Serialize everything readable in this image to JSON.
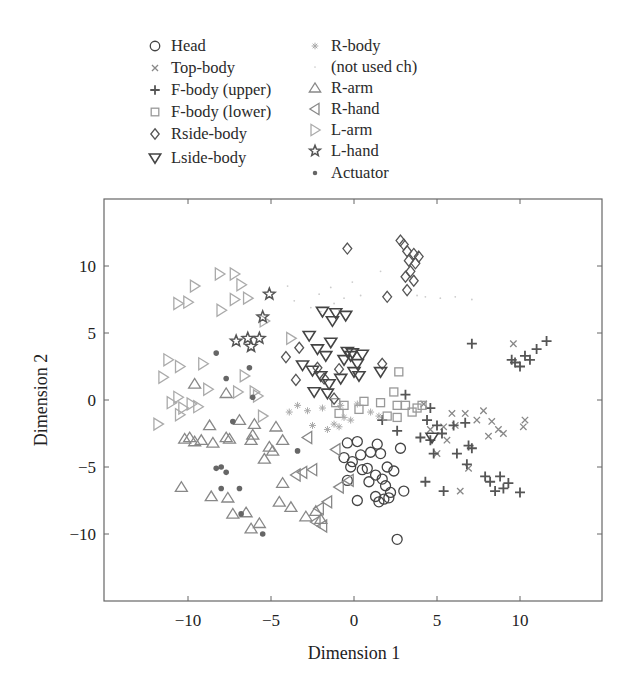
{
  "chart_data": {
    "type": "scatter",
    "title": "",
    "xlabel": "Dimension 1",
    "ylabel": "Dimension 2",
    "xlim": [
      -15,
      15
    ],
    "ylim": [
      -15,
      15
    ],
    "xticks": [
      -10,
      -5,
      0,
      5,
      10
    ],
    "yticks": [
      -10,
      -5,
      0,
      5,
      10
    ],
    "xtick_labels": [
      "−10",
      "−5",
      "0",
      "5",
      "10"
    ],
    "ytick_labels": [
      "−10",
      "−5",
      "0",
      "5",
      "10"
    ],
    "grid": false,
    "legend_position": "above plot, two columns",
    "series": [
      {
        "name": "Head",
        "marker": "circle",
        "color": "#444444",
        "points": [
          [
            -0.4,
            -3.2
          ],
          [
            0.2,
            -3.1
          ],
          [
            1.4,
            -3.3
          ],
          [
            2.8,
            -3.6
          ],
          [
            -0.6,
            -4.3
          ],
          [
            0.4,
            -4.1
          ],
          [
            1.0,
            -3.9
          ],
          [
            1.6,
            -4.0
          ],
          [
            -0.2,
            -5.0
          ],
          [
            0.5,
            -5.2
          ],
          [
            0.8,
            -5.1
          ],
          [
            1.3,
            -5.6
          ],
          [
            2.0,
            -5.0
          ],
          [
            2.4,
            -5.3
          ],
          [
            -0.4,
            -6.0
          ],
          [
            0.9,
            -6.1
          ],
          [
            1.9,
            -6.4
          ],
          [
            2.2,
            -6.9
          ],
          [
            3.0,
            -6.8
          ],
          [
            0.2,
            -7.5
          ],
          [
            1.5,
            -7.6
          ],
          [
            1.8,
            -7.4
          ],
          [
            2.1,
            -7.3
          ],
          [
            1.3,
            -7.2
          ],
          [
            2.6,
            -10.4
          ],
          [
            -0.1,
            -4.6
          ],
          [
            1.7,
            -5.9
          ]
        ]
      },
      {
        "name": "Top-body",
        "marker": "x",
        "color": "#888888",
        "points": [
          [
            4.2,
            -0.3
          ],
          [
            5.4,
            -2.0
          ],
          [
            6.1,
            -1.9
          ],
          [
            7.4,
            -1.5
          ],
          [
            8.3,
            -1.6
          ],
          [
            8.7,
            -2.2
          ],
          [
            9.0,
            -2.5
          ],
          [
            10.2,
            -2.0
          ],
          [
            6.7,
            -1.0
          ],
          [
            7.8,
            -0.8
          ],
          [
            4.6,
            -2.2
          ],
          [
            5.6,
            -3.0
          ],
          [
            5.0,
            -4.0
          ],
          [
            6.9,
            -5.1
          ],
          [
            9.6,
            4.2
          ],
          [
            6.4,
            -6.8
          ],
          [
            10.3,
            -1.5
          ],
          [
            8.1,
            -2.7
          ],
          [
            5.9,
            -1.0
          ]
        ]
      },
      {
        "name": "F-body (upper)",
        "marker": "plus",
        "color": "#555555",
        "points": [
          [
            7.1,
            4.2
          ],
          [
            9.5,
            3.0
          ],
          [
            10.3,
            3.3
          ],
          [
            11.0,
            3.8
          ],
          [
            11.6,
            4.4
          ],
          [
            10.0,
            2.5
          ],
          [
            9.7,
            2.8
          ],
          [
            10.6,
            3.0
          ],
          [
            4.6,
            -0.6
          ],
          [
            4.4,
            -1.5
          ],
          [
            5.0,
            -1.9
          ],
          [
            6.0,
            -1.9
          ],
          [
            6.7,
            -1.7
          ],
          [
            5.3,
            -2.5
          ],
          [
            4.6,
            -3.0
          ],
          [
            6.2,
            -4.0
          ],
          [
            6.9,
            -3.4
          ],
          [
            7.1,
            -3.6
          ],
          [
            4.0,
            -2.8
          ],
          [
            4.8,
            -4.0
          ],
          [
            6.8,
            -4.8
          ],
          [
            7.9,
            -5.7
          ],
          [
            8.2,
            -6.1
          ],
          [
            8.8,
            -5.7
          ],
          [
            9.3,
            -6.2
          ],
          [
            9.0,
            -6.6
          ],
          [
            10.0,
            -6.9
          ],
          [
            8.5,
            -6.8
          ],
          [
            4.3,
            -6.1
          ],
          [
            5.4,
            -6.8
          ],
          [
            3.1,
            0.4
          ],
          [
            2.6,
            -2.3
          ],
          [
            1.7,
            -1.5
          ]
        ]
      },
      {
        "name": "F-body (lower)",
        "marker": "square",
        "color": "#999999",
        "points": [
          [
            2.7,
            2.1
          ],
          [
            2.4,
            0.6
          ],
          [
            0.6,
            -0.1
          ],
          [
            1.6,
            -0.2
          ],
          [
            2.6,
            -0.4
          ],
          [
            3.1,
            -0.4
          ],
          [
            2.0,
            -1.2
          ],
          [
            2.6,
            -1.3
          ],
          [
            3.5,
            -0.9
          ],
          [
            3.8,
            -0.6
          ],
          [
            4.1,
            -0.4
          ],
          [
            -0.6,
            -0.4
          ],
          [
            -1.1,
            -0.2
          ],
          [
            0.3,
            -0.7
          ],
          [
            -0.9,
            -1.0
          ]
        ]
      },
      {
        "name": "Rside-body",
        "marker": "diamond",
        "color": "#555555",
        "points": [
          [
            -0.4,
            11.3
          ],
          [
            2.8,
            11.9
          ],
          [
            3.0,
            11.6
          ],
          [
            3.2,
            11.1
          ],
          [
            3.6,
            10.9
          ],
          [
            3.9,
            10.7
          ],
          [
            3.3,
            10.4
          ],
          [
            3.7,
            10.2
          ],
          [
            3.4,
            9.6
          ],
          [
            3.1,
            9.2
          ],
          [
            3.6,
            8.9
          ],
          [
            3.2,
            8.2
          ],
          [
            2.0,
            7.7
          ],
          [
            -4.1,
            3.2
          ],
          [
            -3.3,
            3.9
          ],
          [
            -2.2,
            2.4
          ],
          [
            -1.8,
            1.6
          ],
          [
            -3.5,
            1.5
          ],
          [
            -0.9,
            2.3
          ],
          [
            -1.2,
            0.1
          ],
          [
            1.7,
            2.7
          ]
        ]
      },
      {
        "name": "Lside-body",
        "marker": "triangle-down",
        "color": "#444444",
        "points": [
          [
            -1.9,
            6.6
          ],
          [
            -1.1,
            6.5
          ],
          [
            -0.5,
            6.3
          ],
          [
            -1.3,
            5.9
          ],
          [
            -2.7,
            4.8
          ],
          [
            -1.4,
            4.3
          ],
          [
            -2.2,
            3.8
          ],
          [
            -1.7,
            3.3
          ],
          [
            -0.4,
            3.6
          ],
          [
            -0.1,
            3.5
          ],
          [
            0.5,
            3.4
          ],
          [
            -0.6,
            3.0
          ],
          [
            0.2,
            2.7
          ],
          [
            -3.1,
            2.6
          ],
          [
            -2.5,
            2.2
          ],
          [
            -2.0,
            1.8
          ],
          [
            -1.5,
            1.2
          ],
          [
            -0.8,
            1.6
          ],
          [
            1.6,
            2.1
          ],
          [
            0.3,
            1.8
          ],
          [
            -2.4,
            0.6
          ],
          [
            -1.6,
            0.5
          ],
          [
            4.7,
            -2.8
          ],
          [
            -0.2,
            3.3
          ],
          [
            0.0,
            2.1
          ]
        ]
      },
      {
        "name": "R-body",
        "marker": "asterisk",
        "color": "#aaaaaa",
        "points": [
          [
            -3.9,
            -0.9
          ],
          [
            -2.8,
            -0.8
          ],
          [
            -1.9,
            -0.6
          ],
          [
            -1.2,
            -1.8
          ],
          [
            -0.6,
            -1.3
          ],
          [
            -0.2,
            -1.5
          ],
          [
            -0.8,
            -0.4
          ],
          [
            -2.5,
            -1.9
          ],
          [
            -1.6,
            -2.2
          ],
          [
            -0.9,
            -2.0
          ],
          [
            0.2,
            -0.3
          ],
          [
            1.0,
            -0.9
          ],
          [
            1.5,
            -1.2
          ],
          [
            -3.4,
            -0.4
          ]
        ]
      },
      {
        "name": "(not used ch)",
        "marker": "dot-small",
        "color": "#cccccc",
        "points": [
          [
            -2.6,
            6.9
          ],
          [
            -2.1,
            7.9
          ],
          [
            -1.4,
            8.4
          ],
          [
            -0.6,
            7.6
          ],
          [
            -1.2,
            7.2
          ],
          [
            -2.0,
            6.6
          ],
          [
            1.6,
            9.6
          ],
          [
            5.2,
            7.6
          ],
          [
            6.1,
            7.7
          ],
          [
            7.1,
            7.5
          ],
          [
            3.8,
            7.8
          ],
          [
            4.3,
            7.7
          ],
          [
            -4.0,
            8.5
          ],
          [
            -3.6,
            7.4
          ],
          [
            -0.1,
            8.8
          ],
          [
            0.4,
            7.8
          ]
        ]
      },
      {
        "name": "R-arm",
        "marker": "triangle-up",
        "color": "#888888",
        "points": [
          [
            -8.7,
            -1.9
          ],
          [
            -9.2,
            -3.0
          ],
          [
            -10.2,
            -2.9
          ],
          [
            -9.9,
            -2.8
          ],
          [
            -9.6,
            -3.1
          ],
          [
            -8.5,
            -3.2
          ],
          [
            -7.7,
            -2.8
          ],
          [
            -7.5,
            -2.9
          ],
          [
            -6.1,
            -2.6
          ],
          [
            -6.2,
            -3.0
          ],
          [
            -6.0,
            -1.8
          ],
          [
            -4.7,
            -2.0
          ],
          [
            -4.3,
            -3.0
          ],
          [
            -5.1,
            -3.5
          ],
          [
            -4.9,
            -3.8
          ],
          [
            -5.4,
            -4.4
          ],
          [
            -10.4,
            -6.5
          ],
          [
            -8.6,
            -7.2
          ],
          [
            -7.6,
            -7.3
          ],
          [
            -7.3,
            -8.5
          ],
          [
            -6.5,
            -8.4
          ],
          [
            -6.2,
            -9.6
          ],
          [
            -5.7,
            -9.2
          ],
          [
            -4.3,
            -6.2
          ],
          [
            -4.5,
            -7.6
          ],
          [
            -3.8,
            -8.0
          ],
          [
            -2.3,
            -8.3
          ],
          [
            -2.0,
            -8.9
          ],
          [
            -2.9,
            -8.7
          ],
          [
            -6.9,
            -1.5
          ],
          [
            -7.7,
            0.5
          ],
          [
            -9.6,
            1.2
          ]
        ]
      },
      {
        "name": "R-hand",
        "marker": "triangle-left",
        "color": "#888888",
        "points": [
          [
            -3.1,
            -5.4
          ],
          [
            -3.5,
            -5.6
          ],
          [
            -2.1,
            -8.1
          ],
          [
            -1.9,
            -9.4
          ],
          [
            -2.3,
            -9.1
          ],
          [
            -1.1,
            -3.7
          ],
          [
            -2.5,
            -5.2
          ],
          [
            -0.3,
            -6.0
          ],
          [
            -2.8,
            -2.8
          ],
          [
            -0.9,
            -6.5
          ],
          [
            -1.6,
            -7.6
          ]
        ]
      },
      {
        "name": "L-arm",
        "marker": "triangle-right",
        "color": "#aaaaaa",
        "points": [
          [
            -9.6,
            8.5
          ],
          [
            -8.1,
            9.4
          ],
          [
            -7.2,
            9.4
          ],
          [
            -6.8,
            8.6
          ],
          [
            -6.4,
            7.6
          ],
          [
            -7.2,
            7.5
          ],
          [
            -8.0,
            6.7
          ],
          [
            -10.6,
            7.2
          ],
          [
            -10.0,
            7.3
          ],
          [
            -5.4,
            5.9
          ],
          [
            -3.8,
            4.6
          ],
          [
            -11.2,
            3.0
          ],
          [
            -10.5,
            2.5
          ],
          [
            -11.5,
            1.7
          ],
          [
            -9.1,
            2.7
          ],
          [
            -6.6,
            1.8
          ],
          [
            -7.0,
            0.6
          ],
          [
            -6.0,
            0.6
          ],
          [
            -5.8,
            0.3
          ],
          [
            -10.6,
            0.2
          ],
          [
            -11.0,
            -0.2
          ],
          [
            -10.3,
            -0.6
          ],
          [
            -9.4,
            -0.5
          ],
          [
            -9.8,
            -0.3
          ],
          [
            -11.8,
            -1.8
          ],
          [
            -10.5,
            -1.1
          ],
          [
            -8.8,
            0.8
          ],
          [
            -5.5,
            -1.2
          ]
        ]
      },
      {
        "name": "L-hand",
        "marker": "star",
        "color": "#555555",
        "points": [
          [
            -5.1,
            7.9
          ],
          [
            -5.5,
            6.2
          ],
          [
            -7.1,
            4.4
          ],
          [
            -6.4,
            4.6
          ],
          [
            -6.2,
            4.0
          ],
          [
            -5.7,
            4.6
          ]
        ]
      },
      {
        "name": "Actuator",
        "marker": "dot",
        "color": "#666666",
        "points": [
          [
            -8.3,
            3.5
          ],
          [
            -7.7,
            1.6
          ],
          [
            -6.3,
            2.4
          ],
          [
            -6.1,
            0.2
          ],
          [
            -7.3,
            -1.6
          ],
          [
            -8.3,
            -5.1
          ],
          [
            -8.0,
            -5.0
          ],
          [
            -7.7,
            -5.4
          ],
          [
            -6.9,
            -6.6
          ],
          [
            -3.4,
            -3.8
          ],
          [
            -6.8,
            -8.5
          ],
          [
            -5.5,
            -10.0
          ],
          [
            -8.0,
            -6.6
          ]
        ]
      }
    ]
  },
  "legend": {
    "left": [
      {
        "label": "Head",
        "marker": "circle"
      },
      {
        "label": "Top-body",
        "marker": "x"
      },
      {
        "label": "F-body (upper)",
        "marker": "plus"
      },
      {
        "label": "F-body (lower)",
        "marker": "square"
      },
      {
        "label": "Rside-body",
        "marker": "diamond"
      },
      {
        "label": "Lside-body",
        "marker": "triangle-down"
      }
    ],
    "right": [
      {
        "label": "R-body",
        "marker": "asterisk"
      },
      {
        "label": "(not used ch)",
        "marker": "dot-small"
      },
      {
        "label": "R-arm",
        "marker": "triangle-up"
      },
      {
        "label": "R-hand",
        "marker": "triangle-left"
      },
      {
        "label": "L-arm",
        "marker": "triangle-right"
      },
      {
        "label": "L-hand",
        "marker": "star"
      },
      {
        "label": "Actuator",
        "marker": "dot"
      }
    ]
  },
  "axes": {
    "xlabel": "Dimension 1",
    "ylabel": "Dimension 2"
  }
}
